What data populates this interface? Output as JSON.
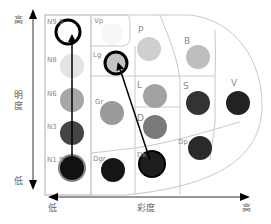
{
  "axes": {
    "vertical": {
      "label": "明度",
      "high": "高",
      "low": "低"
    },
    "horizontal": {
      "label": "彩度",
      "low": "低",
      "high": "高"
    }
  },
  "neutral_column": [
    {
      "label": "N9.5",
      "color": "#ffffff"
    },
    {
      "label": "N8",
      "color": "#e3e3e3"
    },
    {
      "label": "N6",
      "color": "#a6a6a6"
    },
    {
      "label": "N3",
      "color": "#454545"
    },
    {
      "label": "N1.5",
      "color": "#111111"
    }
  ],
  "tones": [
    {
      "label": "Vp",
      "color": "#f7f7f7"
    },
    {
      "label": "Lg",
      "color": "#c4c4c4"
    },
    {
      "label": "Gr",
      "color": "#9a9a9a"
    },
    {
      "label": "Dgr",
      "color": "#151515"
    },
    {
      "label": "P",
      "color": "#cfcfcf"
    },
    {
      "label": "L",
      "color": "#a2a2a2"
    },
    {
      "label": "D",
      "color": "#7a7a7a"
    },
    {
      "label": "Dk",
      "color": "#1e1e1e"
    },
    {
      "label": "B",
      "color": "#bdbdbd"
    },
    {
      "label": "S",
      "color": "#333333"
    },
    {
      "label": "Dp",
      "color": "#2a2a2a"
    },
    {
      "label": "V",
      "color": "#222222"
    }
  ],
  "arrows": [
    {
      "from": "N1.5",
      "to": "N9.5",
      "description": "lightness increase"
    },
    {
      "from": "Dk",
      "to": "Lg",
      "description": "tone shift"
    }
  ]
}
